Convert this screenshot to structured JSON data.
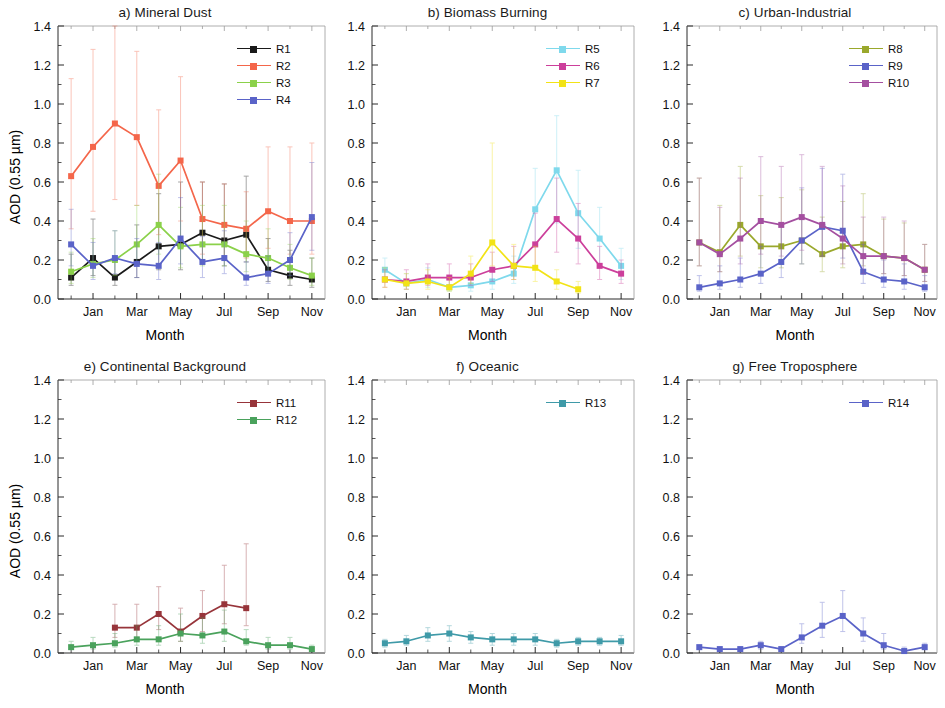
{
  "figure": {
    "y_axis_label": "AOD (0.55 µm)",
    "x_axis_label": "Month",
    "y_ticks": [
      "0.0",
      "0.2",
      "0.4",
      "0.6",
      "0.8",
      "1.0",
      "1.2",
      "1.4"
    ],
    "x_ticks": [
      "Jan",
      "Mar",
      "May",
      "Jul",
      "Sep",
      "Nov"
    ],
    "ylim": [
      0,
      1.4
    ],
    "months": [
      "Dec",
      "Jan",
      "Feb",
      "Mar",
      "Apr",
      "May",
      "Jun",
      "Jul",
      "Aug",
      "Sep",
      "Oct",
      "Nov"
    ]
  },
  "colors": {
    "R1": "#1a1a1a",
    "R2": "#f4664a",
    "R3": "#8bd14a",
    "R4": "#5a63c8",
    "R5": "#7fd9ec",
    "R6": "#cc3f9b",
    "R7": "#f2e316",
    "R8": "#9aa82c",
    "R9": "#5a63c8",
    "R10": "#a44fa0",
    "R11": "#97343a",
    "R12": "#4aa25c",
    "R13": "#3f9aa8",
    "R14": "#5a63c8"
  },
  "panels": [
    {
      "id": "a",
      "title": "a)  Mineral Dust",
      "y_axis_label": "AOD (0.55 µm)",
      "x_axis_label": "Month",
      "legend": [
        "R1",
        "R2",
        "R3",
        "R4"
      ]
    },
    {
      "id": "b",
      "title": "b)  Biomass Burning",
      "y_axis_label": "",
      "x_axis_label": "Month",
      "legend": [
        "R5",
        "R6",
        "R7"
      ]
    },
    {
      "id": "c",
      "title": "c)  Urban-Industrial",
      "y_axis_label": "",
      "x_axis_label": "Month",
      "legend": [
        "R8",
        "R9",
        "R10"
      ]
    },
    {
      "id": "e",
      "title": "e)  Continental Background",
      "y_axis_label": "AOD (0.55 µm)",
      "x_axis_label": "Month",
      "legend": [
        "R11",
        "R12"
      ]
    },
    {
      "id": "f",
      "title": "f)  Oceanic",
      "y_axis_label": "",
      "x_axis_label": "Month",
      "legend": [
        "R13"
      ]
    },
    {
      "id": "g",
      "title": "g)  Free Troposphere",
      "y_axis_label": "",
      "x_axis_label": "Month",
      "legend": [
        "R14"
      ]
    }
  ],
  "chart_data": [
    {
      "panel": "a",
      "type": "line",
      "title": "a)  Mineral Dust",
      "xlabel": "Month",
      "ylabel": "AOD (0.55 µm)",
      "ylim": [
        0,
        1.4
      ],
      "x": [
        "Dec",
        "Jan",
        "Feb",
        "Mar",
        "Apr",
        "May",
        "Jun",
        "Jul",
        "Aug",
        "Sep",
        "Oct",
        "Nov"
      ],
      "grid": false,
      "legend_position": "top-right",
      "series": [
        {
          "name": "R1",
          "values": [
            0.11,
            0.21,
            0.11,
            0.19,
            0.27,
            0.28,
            0.34,
            0.3,
            0.33,
            0.15,
            0.12,
            0.1
          ],
          "err_low": [
            0.04,
            0.09,
            0.04,
            0.08,
            0.12,
            0.13,
            0.15,
            0.13,
            0.14,
            0.06,
            0.05,
            0.04
          ],
          "err_high": [
            0.12,
            0.2,
            0.11,
            0.19,
            0.27,
            0.32,
            0.26,
            0.29,
            0.3,
            0.16,
            0.13,
            0.11
          ]
        },
        {
          "name": "R2",
          "values": [
            0.63,
            0.78,
            0.9,
            0.83,
            0.58,
            0.71,
            0.41,
            0.38,
            0.36,
            0.45,
            0.4,
            0.4
          ],
          "err_low": [
            0.27,
            0.33,
            0.39,
            0.35,
            0.25,
            0.31,
            0.18,
            0.16,
            0.15,
            0.19,
            0.17,
            0.17
          ],
          "err_high": [
            0.5,
            0.5,
            0.5,
            0.44,
            0.39,
            0.43,
            0.19,
            0.21,
            0.19,
            0.33,
            0.38,
            0.4
          ]
        },
        {
          "name": "R3",
          "values": [
            0.14,
            0.18,
            0.2,
            0.28,
            0.38,
            0.27,
            0.28,
            0.28,
            0.23,
            0.21,
            0.16,
            0.12
          ],
          "err_low": [
            0.06,
            0.07,
            0.08,
            0.11,
            0.15,
            0.11,
            0.11,
            0.11,
            0.09,
            0.08,
            0.06,
            0.05
          ],
          "err_high": [
            0.1,
            0.13,
            0.15,
            0.2,
            0.26,
            0.2,
            0.2,
            0.2,
            0.17,
            0.15,
            0.12,
            0.09
          ]
        },
        {
          "name": "R4",
          "values": [
            0.28,
            0.17,
            0.21,
            0.18,
            0.17,
            0.31,
            0.19,
            0.21,
            0.11,
            0.13,
            0.2,
            0.42
          ],
          "err_low": [
            0.11,
            0.07,
            0.08,
            0.07,
            0.07,
            0.13,
            0.08,
            0.08,
            0.04,
            0.05,
            0.08,
            0.17
          ],
          "err_high": [
            0.18,
            0.12,
            0.14,
            0.13,
            0.12,
            0.21,
            0.13,
            0.14,
            0.08,
            0.09,
            0.14,
            0.28
          ]
        }
      ]
    },
    {
      "panel": "b",
      "type": "line",
      "title": "b)  Biomass Burning",
      "xlabel": "Month",
      "ylabel": "",
      "ylim": [
        0,
        1.4
      ],
      "x": [
        "Dec",
        "Jan",
        "Feb",
        "Mar",
        "Apr",
        "May",
        "Jun",
        "Jul",
        "Aug",
        "Sep",
        "Oct",
        "Nov"
      ],
      "grid": false,
      "legend_position": "top-right",
      "series": [
        {
          "name": "R5",
          "values": [
            0.15,
            0.08,
            0.1,
            0.06,
            0.07,
            0.09,
            0.13,
            0.46,
            0.66,
            0.44,
            0.31,
            0.17
          ],
          "err_low": [
            0.06,
            0.03,
            0.04,
            0.02,
            0.03,
            0.04,
            0.05,
            0.19,
            0.27,
            0.18,
            0.13,
            0.07
          ],
          "err_high": [
            0.06,
            0.05,
            0.06,
            0.04,
            0.05,
            0.06,
            0.09,
            0.21,
            0.28,
            0.22,
            0.16,
            0.09
          ]
        },
        {
          "name": "R6",
          "values": [
            0.1,
            0.09,
            0.11,
            0.11,
            0.11,
            0.15,
            0.17,
            0.28,
            0.41,
            0.31,
            0.17,
            0.13
          ],
          "err_low": [
            0.04,
            0.04,
            0.04,
            0.04,
            0.04,
            0.06,
            0.07,
            0.11,
            0.17,
            0.13,
            0.07,
            0.05
          ],
          "err_high": [
            0.05,
            0.06,
            0.07,
            0.07,
            0.07,
            0.09,
            0.1,
            0.16,
            0.21,
            0.18,
            0.1,
            0.07
          ]
        },
        {
          "name": "R7",
          "values": [
            0.1,
            0.08,
            0.09,
            0.06,
            0.13,
            0.29,
            0.17,
            0.16,
            0.09,
            0.05,
            null,
            null
          ],
          "err_low": [
            0.04,
            0.03,
            0.04,
            0.02,
            0.05,
            0.12,
            0.07,
            0.07,
            0.04,
            0.02,
            null,
            null
          ],
          "err_high": [
            0.06,
            0.05,
            0.06,
            0.05,
            0.09,
            0.51,
            0.11,
            0.11,
            0.06,
            0.04,
            null,
            null
          ]
        }
      ]
    },
    {
      "panel": "c",
      "type": "line",
      "title": "c)  Urban-Industrial",
      "xlabel": "Month",
      "ylabel": "",
      "ylim": [
        0,
        1.4
      ],
      "x": [
        "Dec",
        "Jan",
        "Feb",
        "Mar",
        "Apr",
        "May",
        "Jun",
        "Jul",
        "Aug",
        "Sep",
        "Oct",
        "Nov"
      ],
      "grid": false,
      "legend_position": "top-right",
      "series": [
        {
          "name": "R8",
          "values": [
            0.29,
            0.24,
            0.38,
            0.27,
            0.27,
            0.3,
            0.23,
            0.27,
            0.28,
            0.22,
            0.21,
            0.15
          ],
          "err_low": [
            0.12,
            0.1,
            0.16,
            0.11,
            0.11,
            0.12,
            0.09,
            0.11,
            0.11,
            0.09,
            0.09,
            0.06
          ],
          "err_high": [
            0.33,
            0.24,
            0.3,
            0.26,
            0.25,
            0.26,
            0.19,
            0.23,
            0.26,
            0.19,
            0.18,
            0.13
          ]
        },
        {
          "name": "R9",
          "values": [
            0.06,
            0.08,
            0.1,
            0.13,
            0.19,
            0.3,
            0.37,
            0.35,
            0.14,
            0.1,
            0.09,
            0.06
          ],
          "err_low": [
            0.02,
            0.03,
            0.04,
            0.05,
            0.08,
            0.12,
            0.15,
            0.14,
            0.06,
            0.04,
            0.04,
            0.02
          ],
          "err_high": [
            0.06,
            0.09,
            0.11,
            0.14,
            0.19,
            0.27,
            0.3,
            0.29,
            0.14,
            0.1,
            0.09,
            0.06
          ]
        },
        {
          "name": "R10",
          "values": [
            0.29,
            0.23,
            0.31,
            0.4,
            0.38,
            0.42,
            0.38,
            0.31,
            0.22,
            0.22,
            0.21,
            0.15
          ],
          "err_low": [
            0.12,
            0.09,
            0.13,
            0.17,
            0.16,
            0.17,
            0.16,
            0.13,
            0.09,
            0.09,
            0.09,
            0.06
          ],
          "err_high": [
            0.33,
            0.24,
            0.31,
            0.33,
            0.3,
            0.32,
            0.3,
            0.27,
            0.2,
            0.2,
            0.19,
            0.13
          ]
        }
      ]
    },
    {
      "panel": "e",
      "type": "line",
      "title": "e)  Continental Background",
      "xlabel": "Month",
      "ylabel": "AOD (0.55 µm)",
      "ylim": [
        0,
        1.4
      ],
      "x": [
        "Dec",
        "Jan",
        "Feb",
        "Mar",
        "Apr",
        "May",
        "Jun",
        "Jul",
        "Aug",
        "Sep",
        "Oct",
        "Nov"
      ],
      "grid": false,
      "legend_position": "top-right",
      "series": [
        {
          "name": "R11",
          "values": [
            null,
            null,
            0.13,
            0.13,
            0.2,
            0.11,
            0.19,
            0.25,
            0.23,
            null,
            null,
            null
          ],
          "err_low": [
            null,
            null,
            0.05,
            0.05,
            0.08,
            0.05,
            0.08,
            0.1,
            0.09,
            null,
            null,
            null
          ],
          "err_high": [
            null,
            null,
            0.12,
            0.12,
            0.14,
            0.12,
            0.13,
            0.2,
            0.33,
            null,
            null,
            null
          ]
        },
        {
          "name": "R12",
          "values": [
            0.03,
            0.04,
            0.05,
            0.07,
            0.07,
            0.1,
            0.09,
            0.11,
            0.06,
            0.04,
            0.04,
            0.02
          ],
          "err_low": [
            0.01,
            0.02,
            0.02,
            0.03,
            0.03,
            0.04,
            0.04,
            0.05,
            0.02,
            0.02,
            0.02,
            0.01
          ],
          "err_high": [
            0.03,
            0.04,
            0.05,
            0.07,
            0.07,
            0.1,
            0.09,
            0.11,
            0.06,
            0.04,
            0.04,
            0.02
          ]
        }
      ]
    },
    {
      "panel": "f",
      "type": "line",
      "title": "f)  Oceanic",
      "xlabel": "Month",
      "ylabel": "",
      "ylim": [
        0,
        1.4
      ],
      "x": [
        "Dec",
        "Jan",
        "Feb",
        "Mar",
        "Apr",
        "May",
        "Jun",
        "Jul",
        "Aug",
        "Sep",
        "Oct",
        "Nov"
      ],
      "grid": false,
      "legend_position": "top-right",
      "series": [
        {
          "name": "R13",
          "values": [
            0.05,
            0.06,
            0.09,
            0.1,
            0.08,
            0.07,
            0.07,
            0.07,
            0.05,
            0.06,
            0.06,
            0.06
          ],
          "err_low": [
            0.02,
            0.02,
            0.03,
            0.04,
            0.03,
            0.03,
            0.03,
            0.03,
            0.02,
            0.02,
            0.02,
            0.02
          ],
          "err_high": [
            0.02,
            0.03,
            0.04,
            0.04,
            0.03,
            0.03,
            0.03,
            0.03,
            0.02,
            0.02,
            0.02,
            0.03
          ]
        }
      ]
    },
    {
      "panel": "g",
      "type": "line",
      "title": "g)  Free Troposphere",
      "xlabel": "Month",
      "ylabel": "",
      "ylim": [
        0,
        1.4
      ],
      "x": [
        "Dec",
        "Jan",
        "Feb",
        "Mar",
        "Apr",
        "May",
        "Jun",
        "Jul",
        "Aug",
        "Sep",
        "Oct",
        "Nov"
      ],
      "grid": false,
      "legend_position": "top-right",
      "series": [
        {
          "name": "R14",
          "values": [
            0.03,
            0.02,
            0.02,
            0.04,
            0.02,
            0.08,
            0.14,
            0.19,
            0.1,
            0.04,
            0.01,
            0.03
          ],
          "err_low": [
            0.01,
            0.01,
            0.01,
            0.02,
            0.01,
            0.03,
            0.06,
            0.08,
            0.04,
            0.02,
            0.0,
            0.01
          ],
          "err_high": [
            0.01,
            0.01,
            0.01,
            0.02,
            0.01,
            0.07,
            0.12,
            0.13,
            0.08,
            0.06,
            0.02,
            0.02
          ]
        }
      ]
    }
  ]
}
